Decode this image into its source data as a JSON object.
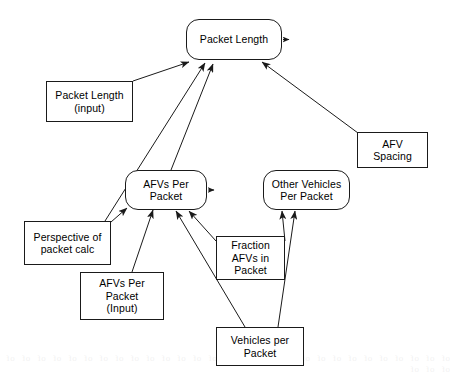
{
  "diagram": {
    "type": "influence-diagram",
    "stroke_color": "#1a1a1a",
    "fill_color": "#ffffff",
    "text_color": "#000000",
    "nodes": [
      {
        "id": "packet-length",
        "label": "Packet Length",
        "shape": "rounded-rectangle",
        "x": 186,
        "y": 19,
        "w": 96,
        "h": 41,
        "has_output_stub": true
      },
      {
        "id": "packet-length-input",
        "label": "Packet Length\n(input)",
        "shape": "rectangle",
        "x": 46,
        "y": 81,
        "w": 87,
        "h": 41,
        "has_output_stub": false
      },
      {
        "id": "afv-spacing",
        "label": "AFV\nSpacing",
        "shape": "rectangle",
        "x": 357,
        "y": 132,
        "w": 71,
        "h": 36,
        "has_output_stub": false
      },
      {
        "id": "afvs-per-packet",
        "label": "AFVs Per\nPacket",
        "shape": "rounded-rectangle",
        "x": 125,
        "y": 170,
        "w": 82,
        "h": 40,
        "has_output_stub": true
      },
      {
        "id": "other-vehicles-per-packet",
        "label": "Other Vehicles\nPer Packet",
        "shape": "rounded-rectangle",
        "x": 263,
        "y": 170,
        "w": 87,
        "h": 40,
        "has_output_stub": false
      },
      {
        "id": "perspective-of-packet-calc",
        "label": "Perspective of\npacket calc",
        "shape": "rectangle",
        "x": 24,
        "y": 221,
        "w": 87,
        "h": 44,
        "has_output_stub": false
      },
      {
        "id": "fraction-afvs-in-packet",
        "label": "Fraction\nAFVs in\nPacket",
        "shape": "rectangle",
        "x": 216,
        "y": 236,
        "w": 69,
        "h": 44,
        "has_output_stub": false
      },
      {
        "id": "afvs-per-packet-input",
        "label": "AFVs Per\nPacket\n(Input)",
        "shape": "rectangle",
        "x": 80,
        "y": 272,
        "w": 84,
        "h": 48,
        "has_output_stub": false
      },
      {
        "id": "vehicles-per-packet",
        "label": "Vehicles per\nPacket",
        "shape": "rectangle",
        "x": 216,
        "y": 327,
        "w": 88,
        "h": 39,
        "has_output_stub": false
      }
    ],
    "edges": [
      {
        "id": "e1",
        "from": "packet-length-input",
        "to": "packet-length",
        "x1": 133,
        "y1": 81,
        "x2": 189,
        "y2": 62
      },
      {
        "id": "e2",
        "from": "perspective-of-packet-calc",
        "to": "packet-length",
        "x1": 105,
        "y1": 221,
        "x2": 205,
        "y2": 63
      },
      {
        "id": "e3",
        "from": "afvs-per-packet",
        "to": "packet-length",
        "x1": 171,
        "y1": 170,
        "x2": 213,
        "y2": 64
      },
      {
        "id": "e4",
        "from": "afv-spacing",
        "to": "packet-length",
        "x1": 358,
        "y1": 133,
        "x2": 262,
        "y2": 62
      },
      {
        "id": "e5",
        "from": "perspective-of-packet-calc",
        "to": "afvs-per-packet",
        "x1": 111,
        "y1": 222,
        "x2": 127,
        "y2": 208
      },
      {
        "id": "e6",
        "from": "afvs-per-packet-input",
        "to": "afvs-per-packet",
        "x1": 132,
        "y1": 272,
        "x2": 153,
        "y2": 210
      },
      {
        "id": "e7",
        "from": "vehicles-per-packet",
        "to": "afvs-per-packet",
        "x1": 245,
        "y1": 327,
        "x2": 176,
        "y2": 211
      },
      {
        "id": "e8",
        "from": "fraction-afvs-in-packet",
        "to": "afvs-per-packet",
        "x1": 216,
        "y1": 241,
        "x2": 189,
        "y2": 211
      },
      {
        "id": "e9",
        "from": "fraction-afvs-in-packet",
        "to": "other-vehicles-per-packet",
        "x1": 285,
        "y1": 241,
        "x2": 282,
        "y2": 211
      },
      {
        "id": "e10",
        "from": "vehicles-per-packet",
        "to": "other-vehicles-per-packet",
        "x1": 278,
        "y1": 327,
        "x2": 295,
        "y2": 211
      }
    ]
  },
  "background": {
    "bleed_text": "of of of of of of of of of of of of of of of of of of of of of of of of of of of of of of of of"
  }
}
